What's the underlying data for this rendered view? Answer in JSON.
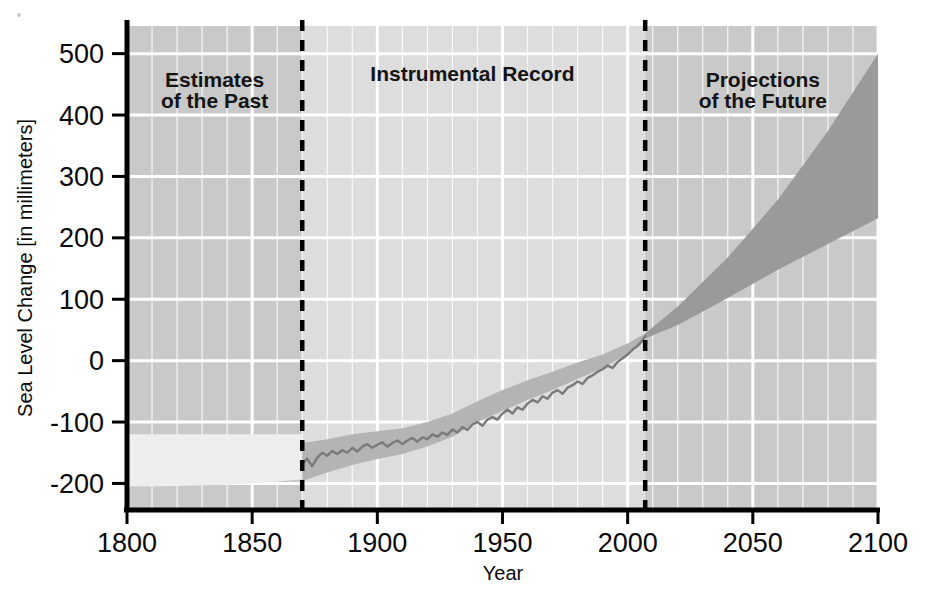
{
  "chart_data": {
    "type": "area",
    "title": "",
    "xlabel": "Year",
    "ylabel": "Sea Level Change [in millimeters]",
    "xlim": [
      1800,
      2100
    ],
    "ylim": [
      -240,
      545
    ],
    "x_ticks": [
      1800,
      1850,
      1900,
      1950,
      2000,
      2050,
      2100
    ],
    "x_tick_labels": [
      "1800",
      "1850",
      "1900",
      "1950",
      "2000",
      "2050",
      "2100"
    ],
    "y_ticks": [
      -200,
      -100,
      0,
      100,
      200,
      300,
      400,
      500
    ],
    "y_tick_labels": [
      "-200",
      "-100",
      "0",
      "100",
      "200",
      "300",
      "400",
      "500"
    ],
    "grid": true,
    "grid_major_x_step": 50,
    "grid_minor_x_step": 10,
    "grid_major_y_step": 100,
    "legend": "none",
    "panel_dividers": [
      1870,
      2007
    ],
    "annotations": [
      {
        "text_line1": "Estimates",
        "text_line2": "of the Past",
        "x": 1835,
        "y": 445
      },
      {
        "text_line1": "Instrumental Record",
        "text_line2": "",
        "x": 1938,
        "y": 455
      },
      {
        "text_line1": "Projections",
        "text_line2": "of the Future",
        "x": 2054,
        "y": 445
      }
    ],
    "series": [
      {
        "name": "Estimates of the Past (uncertainty band)",
        "type": "band",
        "x": [
          1800,
          1820,
          1840,
          1860,
          1870
        ],
        "upper": [
          -120,
          -120,
          -120,
          -120,
          -120
        ],
        "lower": [
          -205,
          -204,
          -202,
          -197,
          -193
        ]
      },
      {
        "name": "Instrumental Record (uncertainty band)",
        "type": "band",
        "x": [
          1870,
          1880,
          1890,
          1900,
          1910,
          1920,
          1930,
          1940,
          1950,
          1960,
          1970,
          1980,
          1990,
          2000,
          2007
        ],
        "upper": [
          -134,
          -128,
          -120,
          -115,
          -110,
          -100,
          -86,
          -66,
          -48,
          -32,
          -18,
          -3,
          10,
          28,
          44
        ],
        "lower": [
          -196,
          -182,
          -170,
          -160,
          -152,
          -140,
          -124,
          -100,
          -82,
          -64,
          -48,
          -30,
          -12,
          10,
          32
        ]
      },
      {
        "name": "Instrumental Record (mean)",
        "type": "line",
        "color": "#7a7a7a",
        "x": [
          1870,
          1872,
          1874,
          1876,
          1878,
          1880,
          1882,
          1884,
          1886,
          1888,
          1890,
          1892,
          1894,
          1896,
          1898,
          1900,
          1902,
          1904,
          1906,
          1908,
          1910,
          1912,
          1914,
          1916,
          1918,
          1920,
          1922,
          1924,
          1926,
          1928,
          1930,
          1932,
          1934,
          1936,
          1938,
          1940,
          1942,
          1944,
          1946,
          1948,
          1950,
          1952,
          1954,
          1956,
          1958,
          1960,
          1962,
          1964,
          1966,
          1968,
          1970,
          1972,
          1974,
          1976,
          1978,
          1980,
          1982,
          1984,
          1986,
          1988,
          1990,
          1992,
          1994,
          1996,
          1998,
          2000,
          2002,
          2004,
          2006,
          2007
        ],
        "y": [
          -168,
          -160,
          -172,
          -158,
          -150,
          -155,
          -147,
          -152,
          -146,
          -150,
          -142,
          -148,
          -140,
          -136,
          -142,
          -137,
          -133,
          -140,
          -134,
          -130,
          -136,
          -130,
          -126,
          -132,
          -125,
          -128,
          -120,
          -124,
          -117,
          -121,
          -112,
          -117,
          -108,
          -113,
          -104,
          -100,
          -106,
          -96,
          -92,
          -96,
          -86,
          -80,
          -86,
          -76,
          -80,
          -70,
          -64,
          -68,
          -58,
          -62,
          -52,
          -48,
          -54,
          -44,
          -40,
          -34,
          -38,
          -28,
          -24,
          -18,
          -14,
          -8,
          -12,
          -2,
          4,
          10,
          18,
          24,
          34,
          40
        ]
      },
      {
        "name": "Projections of the Future (range)",
        "type": "band",
        "x": [
          2007,
          2020,
          2040,
          2060,
          2080,
          2100
        ],
        "upper": [
          44,
          88,
          168,
          262,
          374,
          500
        ],
        "lower": [
          36,
          58,
          102,
          148,
          190,
          232
        ]
      }
    ]
  },
  "colors": {
    "background": "#ffffff",
    "panel_past": "#c9c9c9",
    "panel_instrumental": "#dddddd",
    "panel_future": "#c9c9c9",
    "gridline": "#ffffff",
    "axis": "#000000",
    "divider": "#000000",
    "band_past": "#eeeeee",
    "band_instrumental": "#b4b4b4",
    "line_instrumental": "#7a7a7a",
    "band_future": "#9a9a9a",
    "text": "#0a0a0a"
  }
}
